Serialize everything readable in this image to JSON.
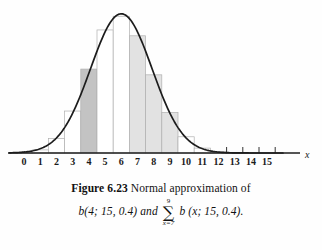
{
  "figure": {
    "number": "Figure 6.23",
    "caption_line_1": "Normal approximation of",
    "caption_part_a": "b(4; 15, 0.4) and",
    "caption_sum_upper": "9",
    "caption_sum_symbol": "∑",
    "caption_sum_lower": "x=7",
    "caption_part_b": "b (x; 15, 0.4)."
  },
  "chart_data": {
    "type": "bar",
    "xlabel": "x",
    "ylabel": "",
    "xlim": [
      -0.8,
      15.8
    ],
    "ylim": [
      0,
      0.21
    ],
    "grid": false,
    "legend": "none",
    "categories": [
      0,
      1,
      2,
      3,
      4,
      5,
      6,
      7,
      8,
      9,
      10,
      11,
      12,
      13,
      14,
      15
    ],
    "values": [
      0.0005,
      0.0047,
      0.0219,
      0.0634,
      0.1268,
      0.1859,
      0.2066,
      0.1771,
      0.1181,
      0.0612,
      0.0245,
      0.0074,
      0.0016,
      0.0003,
      0.0,
      0.0
    ],
    "bar_fills": [
      "none",
      "none",
      "none",
      "none",
      "dark",
      "none",
      "none",
      "light",
      "light",
      "light",
      "none",
      "none",
      "none",
      "none",
      "none",
      "none"
    ],
    "highlighted_single_bar": 4,
    "highlighted_range": [
      7,
      9
    ],
    "tick_labels": [
      "0",
      "1",
      "2",
      "3",
      "4",
      "5",
      "6",
      "7",
      "8",
      "9",
      "10",
      "11",
      "12",
      "13",
      "14",
      "15"
    ],
    "overlay_curve": {
      "type": "line",
      "name": "normal density",
      "mean": 6.0,
      "sigma": 1.897,
      "amplitude": 0.2103
    }
  },
  "colors": {
    "curve": "#1c1c1c",
    "axis": "#1c1c1c",
    "bar_outline": "#b0b0b0",
    "bar_fill_dark": "#c3c3c3",
    "bar_fill_light": "#e2e2e2",
    "bar_fill_none": "#ffffff",
    "text": "#111111",
    "background": "#fefefe"
  }
}
